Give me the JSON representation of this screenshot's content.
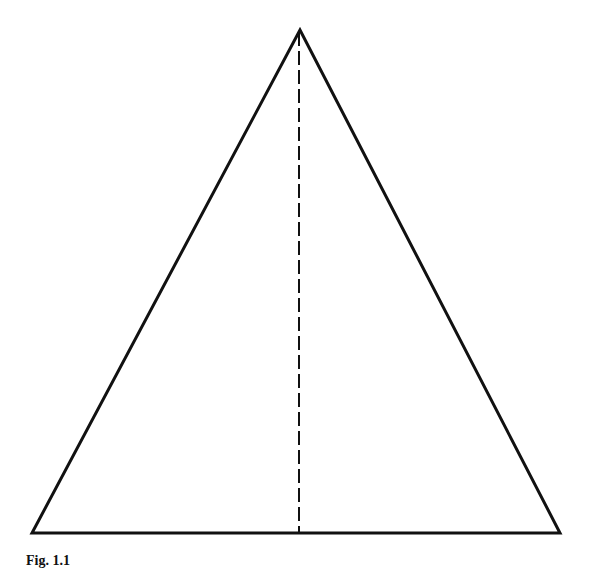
{
  "figure": {
    "caption": "Fig. 1.1",
    "shape": "isosceles-triangle",
    "stroke_color": "#111111",
    "background": "#ffffff",
    "vertices": {
      "apex": [
        300,
        30
      ],
      "bottom_left": [
        32,
        533
      ],
      "bottom_right": [
        560,
        533
      ]
    },
    "median": {
      "x": 299,
      "y_top": 32,
      "y_bottom": 533,
      "style": "dashed"
    }
  }
}
